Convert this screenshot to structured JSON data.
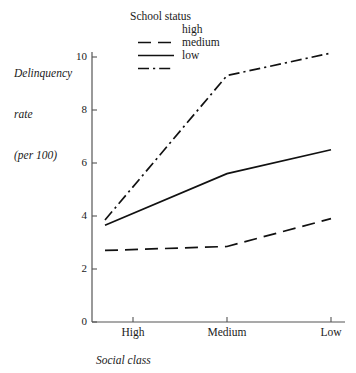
{
  "chart_data": {
    "type": "line",
    "title": "",
    "xlabel": "Social class",
    "ylabel": "Delinquency rate (per 100)",
    "ylabel_lines": [
      "Delinquency",
      "rate",
      "(per 100)"
    ],
    "categories": [
      "High",
      "Medium",
      "Low"
    ],
    "yticks": [
      0,
      2,
      4,
      6,
      8,
      10
    ],
    "ylim": [
      0,
      10.6
    ],
    "grid": false,
    "legend_position": "top-center",
    "legend_title": "School status",
    "series": [
      {
        "name": "high",
        "values": [
          2.7,
          2.85,
          3.9
        ],
        "linestyle": "dashed",
        "color": "#111111"
      },
      {
        "name": "medium",
        "values": [
          3.65,
          5.6,
          6.5
        ],
        "linestyle": "solid",
        "color": "#111111"
      },
      {
        "name": "low",
        "values": [
          3.85,
          9.3,
          10.15
        ],
        "linestyle": "dashdot",
        "color": "#111111"
      }
    ]
  },
  "axis": {
    "y_tick_labels": [
      "0",
      "2",
      "4",
      "6",
      "8",
      "10"
    ],
    "x_tick_labels": [
      "High",
      "Medium",
      "Low"
    ]
  },
  "legend": {
    "title": "School status",
    "entries": [
      {
        "label": "high",
        "style": "dashed"
      },
      {
        "label": "medium",
        "style": "solid"
      },
      {
        "label": "low",
        "style": "dashdot"
      }
    ]
  },
  "colors": {
    "line": "#111111",
    "axis": "#555555",
    "text": "#1a1a1a",
    "background": "#ffffff"
  }
}
